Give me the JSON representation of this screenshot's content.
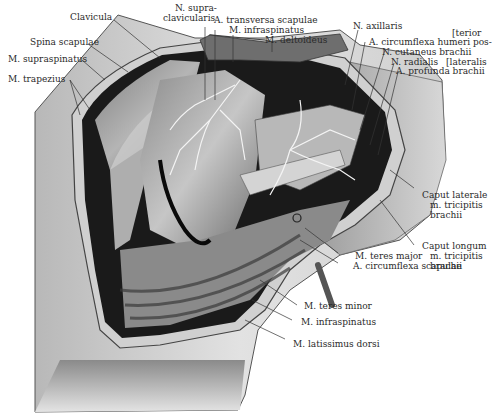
{
  "figure": {
    "labels": {
      "clavicula": "Clavicula",
      "spina_scapulae": "Spina scapulae",
      "m_supraspinatus": "M. supraspinatus",
      "m_trapezius": "M. trapezius",
      "n_supraclavicularis_1": "N. supra-",
      "n_supraclavicularis_2": "clavicularis",
      "a_transversa_scapulae": "A. transversa scapulae",
      "m_infraspinatus_top": "M. infraspinatus",
      "m_deltoideus": "M. deltoideus",
      "n_axillaris": "N. axillaris",
      "a_circumflexa_humeri_1": "A. circumflexa humeri pos-",
      "a_circumflexa_humeri_2": "[terior",
      "n_cutaneus_brachii": "N. cutaneus brachii",
      "n_radialis": "N. radialis",
      "a_profunda_brachii_1": "A. profunda brachii",
      "a_profunda_brachii_2": "[lateralis",
      "caput_laterale_1": "Caput laterale",
      "caput_laterale_2": "m. tricipitis",
      "caput_laterale_3": "brachii",
      "caput_longum_1": "Caput longum",
      "caput_longum_2": "m. tricipitis",
      "caput_longum_3": "brachii",
      "m_teres_major": "M. teres major",
      "a_circumflexa_scapulae": "A. circumflexa scapulae",
      "m_teres_minor": "M. teres minor",
      "m_infraspinatus_bottom": "M. infraspinatus",
      "m_latissimus_dorsi": "M. latissimus dorsi"
    },
    "colors": {
      "background": "#ffffff",
      "skin_light": "#d9d9d9",
      "skin_mid": "#a8a8a8",
      "muscle_dark": "#3a3a3a",
      "cavity": "#161616",
      "nerve": "#f2f2f2",
      "leader": "#333333"
    }
  }
}
